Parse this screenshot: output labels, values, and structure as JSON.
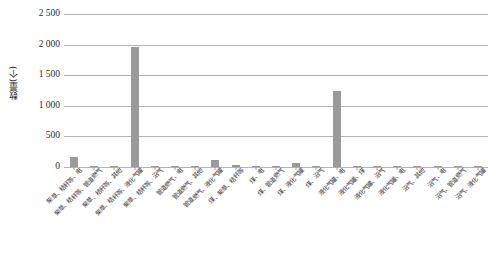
{
  "chart": {
    "type": "bar",
    "title": "",
    "ylabel": "数量(个)",
    "xlabel": ""
  },
  "axis": {
    "y_ticks": [
      "2 500",
      "2 000",
      "1 500",
      "1 000",
      "500",
      "0"
    ]
  },
  "chart_data": {
    "type": "bar",
    "title": "",
    "xlabel": "",
    "ylabel": "数量(个)",
    "ylim": [
      0,
      2500
    ],
    "ytick_labels": [
      "0",
      "500",
      "1 000",
      "1 500",
      "2 000",
      "2 500"
    ],
    "ytick_values": [
      0,
      500,
      1000,
      1500,
      2000,
      2500
    ],
    "grid": true,
    "legend": false,
    "bar_color": "#9a9a9a",
    "categories": [
      "柴草、秸秆等、电",
      "柴草、秸秆等、管道燃气",
      "柴草、秸秆等、其他",
      "柴草、秸秆等、液化气罐",
      "柴草、秸秆等、沼气",
      "管道燃气、电",
      "管道燃气、其他",
      "管道燃气、液化气罐",
      "煤、柴草、秸秆等",
      "煤、电",
      "煤、管道燃气",
      "煤、液化气罐",
      "煤、沼气",
      "液化气罐、电",
      "液化气罐、煤",
      "液化气罐、沼气",
      "液化气罐、电",
      "沼气、其他",
      "沼气、电",
      "沼气、管道燃气",
      "沼气、液化气罐"
    ],
    "values": [
      170,
      22,
      8,
      1960,
      12,
      10,
      20,
      110,
      35,
      6,
      5,
      58,
      8,
      1245,
      12,
      8,
      10,
      8,
      8,
      8,
      22
    ]
  }
}
